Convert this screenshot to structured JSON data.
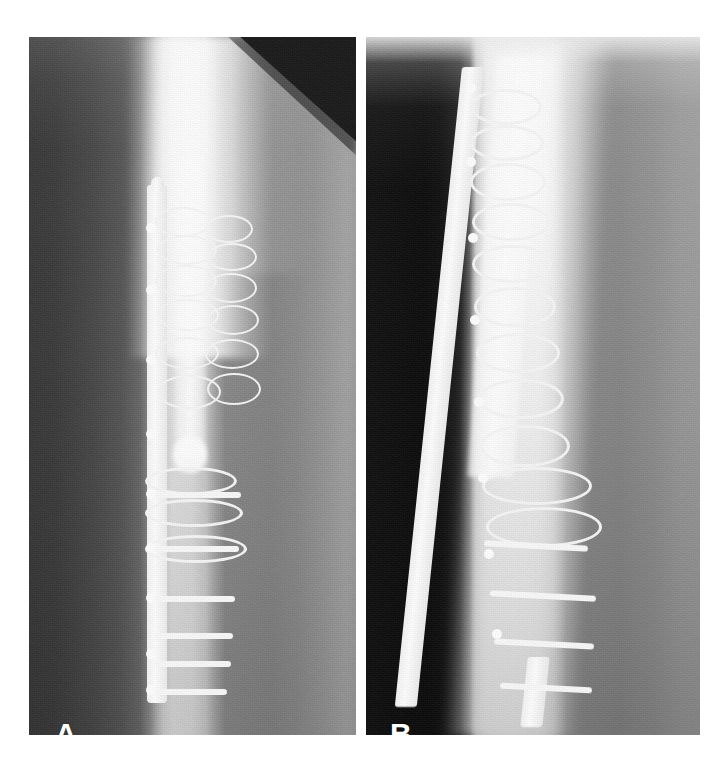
{
  "figure": {
    "type": "radiograph-figure",
    "panel_count": 2,
    "background_color": "#ffffff"
  },
  "panels": [
    {
      "id": "panel-a",
      "label": "A",
      "view": "anteroposterior",
      "label_color": "#ffffff",
      "geometry": {
        "x": 29,
        "y": 37,
        "width": 327,
        "height": 698
      },
      "features": {
        "dark_corner": "top-right dark triangular exposure artifact",
        "implant": "longitudinal metal plate along mid shaft",
        "screw_count": 9,
        "cerclage_wire_count": 6
      }
    },
    {
      "id": "panel-b",
      "label": "B",
      "view": "lateral",
      "label_color": "#ffffff",
      "geometry": {
        "x": 366,
        "y": 37,
        "width": 334,
        "height": 698
      },
      "features": {
        "top_band": "bright collimation band along upper edge",
        "implant": "obliquely oriented metal plate",
        "screw_count": 8,
        "cerclage_wire_count": 9
      }
    }
  ],
  "labels": {
    "panel_a": "A",
    "panel_b": "B"
  },
  "colors": {
    "page_background": "#ffffff",
    "metal_bright": "#fbfbfb",
    "bone_light": "#e6e6e6",
    "soft_tissue_mid": "#8c8c8c",
    "panel_a_dark_edge": "#3a3a3a",
    "panel_b_dark_edge": "#1f1f1f",
    "dark_corner": "#1b1b1b",
    "label_text": "#ffffff"
  }
}
